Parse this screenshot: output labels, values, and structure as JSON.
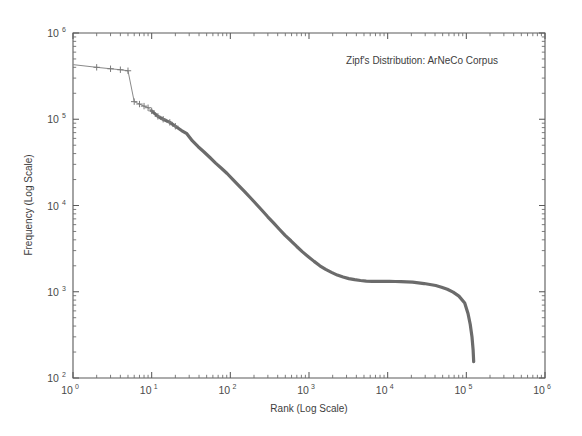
{
  "figure": {
    "width": 582,
    "height": 436,
    "background_color": "#ffffff",
    "annotation": "Zipf's Distribution: ArNeCo Corpus"
  },
  "chart_data": {
    "type": "line",
    "title": "Zipf's Distribution: ArNeCo Corpus",
    "xlabel": "Rank (Log Scale)",
    "ylabel": "Frequency (Log Scale)",
    "xscale": "log",
    "yscale": "log",
    "xlim": [
      1,
      1000000
    ],
    "ylim": [
      100,
      1000000
    ],
    "grid": false,
    "legend": null,
    "xtick_labels": [
      "10^0",
      "10^1",
      "10^2",
      "10^3",
      "10^4",
      "10^5",
      "10^6"
    ],
    "ytick_labels": [
      "10^2",
      "10^3",
      "10^4",
      "10^5",
      "10^6"
    ],
    "xtick_values": [
      1,
      10,
      100,
      1000,
      10000,
      100000,
      1000000
    ],
    "ytick_values": [
      100,
      1000,
      10000,
      100000,
      1000000
    ],
    "marker": "+",
    "line_color": "#6b6b6b",
    "series": [
      {
        "name": "ArNeCo Corpus word frequency",
        "x": [
          1,
          2,
          3,
          4,
          5,
          6,
          7,
          8,
          9,
          10,
          12,
          14,
          17,
          20,
          24,
          28,
          33,
          39,
          46,
          55,
          65,
          77,
          91,
          108,
          128,
          152,
          180,
          213,
          252,
          299,
          354,
          420,
          497,
          589,
          698,
          827,
          980,
          1161,
          1375,
          1630,
          1931,
          2288,
          2711,
          3212,
          3805,
          4508,
          5341,
          6328,
          7498,
          8883,
          10524,
          12470,
          14774,
          17504,
          20738,
          24569,
          29108,
          34485,
          40856,
          48404,
          57346,
          67940,
          80487,
          95351,
          105000,
          112000,
          118000,
          122000,
          124000
        ],
        "y": [
          430000,
          400000,
          385000,
          375000,
          365000,
          160000,
          150000,
          142000,
          136000,
          125000,
          108000,
          100000,
          92000,
          83000,
          74000,
          68000,
          56000,
          48000,
          42000,
          36000,
          31000,
          27000,
          23500,
          20000,
          17000,
          14500,
          12300,
          10400,
          8800,
          7400,
          6300,
          5300,
          4500,
          3900,
          3350,
          2900,
          2550,
          2250,
          2000,
          1820,
          1680,
          1560,
          1480,
          1420,
          1380,
          1350,
          1330,
          1320,
          1320,
          1320,
          1320,
          1315,
          1310,
          1300,
          1290,
          1270,
          1245,
          1215,
          1180,
          1130,
          1070,
          990,
          890,
          740,
          560,
          420,
          300,
          210,
          155
        ]
      }
    ],
    "annotations": [
      {
        "text": "Zipf's Distribution: ArNeCo Corpus",
        "x": 0.73,
        "y": 0.94
      }
    ]
  },
  "axes": {
    "x_axis_title": "Rank (Log Scale)",
    "y_axis_title": "Frequency (Log Scale)",
    "tick_mantissa": "10",
    "x_exponents": [
      "0",
      "1",
      "2",
      "3",
      "4",
      "5",
      "6"
    ],
    "y_exponents": [
      "2",
      "3",
      "4",
      "5",
      "6"
    ]
  }
}
